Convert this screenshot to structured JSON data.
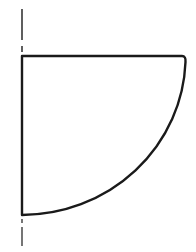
{
  "diagram": {
    "colors": {
      "background": "#ffffff",
      "stroke": "#1a1a1a"
    },
    "axis": {
      "x": 22,
      "top_segment": {
        "y1": 9,
        "y2": 40
      },
      "bottom_segment": {
        "y1": 225,
        "y2": 246
      },
      "style": "dashed"
    },
    "shape": {
      "type": "quarter-ellipse",
      "corner": {
        "x": 22,
        "y": 56
      },
      "top_edge_end": {
        "x": 184,
        "y": 56
      },
      "bottom_point": {
        "x": 22,
        "y": 215
      },
      "radius_x": 164,
      "radius_y": 159
    }
  }
}
